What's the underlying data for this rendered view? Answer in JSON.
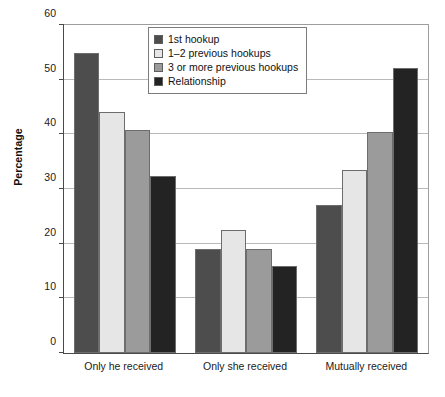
{
  "chart_data": {
    "type": "bar",
    "title": "",
    "xlabel": "",
    "ylabel": "Percentage",
    "ylim": [
      0,
      60
    ],
    "yticks": [
      0,
      10,
      20,
      30,
      40,
      50,
      60
    ],
    "ytick_labels": [
      "0",
      "10",
      "20",
      "30",
      "40",
      "50",
      "60"
    ],
    "grid": true,
    "legend_position": "top-center",
    "categories": [
      "Only he received",
      "Only she received",
      "Mutually received"
    ],
    "series": [
      {
        "name": "1st hookup",
        "color": "#4d4d4d",
        "values": [
          54.8,
          19.0,
          27.0
        ]
      },
      {
        "name": "1–2 previous hookups",
        "color": "#e6e6e6",
        "values": [
          44.1,
          22.5,
          33.4
        ]
      },
      {
        "name": "3 or more previous hookups",
        "color": "#9b9b9b",
        "values": [
          40.8,
          19.1,
          40.5
        ]
      },
      {
        "name": "Relationship",
        "color": "#232323",
        "values": [
          32.4,
          16.0,
          52.2
        ]
      }
    ]
  }
}
